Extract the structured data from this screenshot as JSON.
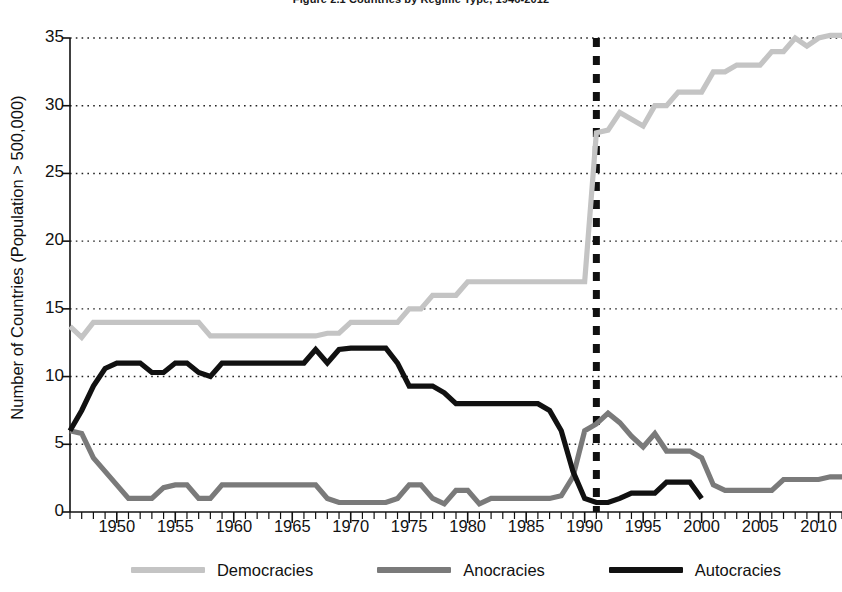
{
  "chart_data": {
    "type": "line",
    "title": "Figure 2.1 Countries by Regime Type, 1946-2012",
    "xlabel": "",
    "ylabel": "Number of Countries (Population > 500,000)",
    "xlim": [
      1946,
      2012
    ],
    "ylim": [
      0,
      35
    ],
    "yticks": [
      0,
      5,
      10,
      15,
      20,
      25,
      30,
      35
    ],
    "xticks": [
      1950,
      1955,
      1960,
      1965,
      1970,
      1975,
      1980,
      1985,
      1990,
      1995,
      2000,
      2005,
      2010
    ],
    "xtick_minor_step": 1,
    "grid": "horizontal-dotted",
    "legend_position": "bottom",
    "annotations": [
      {
        "type": "vline",
        "x": 1991,
        "style": "dashed",
        "color": "#111111",
        "width": 7
      }
    ],
    "x": [
      1946,
      1947,
      1948,
      1949,
      1950,
      1951,
      1952,
      1953,
      1954,
      1955,
      1956,
      1957,
      1958,
      1959,
      1960,
      1961,
      1962,
      1963,
      1964,
      1965,
      1966,
      1967,
      1968,
      1969,
      1970,
      1971,
      1972,
      1973,
      1974,
      1975,
      1976,
      1977,
      1978,
      1979,
      1980,
      1981,
      1982,
      1983,
      1984,
      1985,
      1986,
      1987,
      1988,
      1989,
      1990,
      1991,
      1992,
      1993,
      1994,
      1995,
      1996,
      1997,
      1998,
      1999,
      2000,
      2001,
      2002,
      2003,
      2004,
      2005,
      2006,
      2007,
      2008,
      2009,
      2010,
      2011,
      2012
    ],
    "series": [
      {
        "name": "Democracies",
        "color": "#c4c4c4",
        "values": [
          13.7,
          12.9,
          14,
          14,
          14,
          14,
          14,
          14,
          14,
          14,
          14,
          14,
          13,
          13,
          13,
          13,
          13,
          13,
          13,
          13,
          13,
          13,
          13.2,
          13.2,
          14,
          14,
          14,
          14,
          14,
          15,
          15,
          16,
          16,
          16,
          17,
          17,
          17,
          17,
          17,
          17,
          17,
          17,
          17,
          17,
          17,
          28,
          28.2,
          29.5,
          29,
          28.5,
          30,
          30,
          31,
          31,
          31,
          32.5,
          32.5,
          33,
          33,
          33,
          34,
          34,
          35,
          34.4,
          35,
          35.2,
          35.2
        ]
      },
      {
        "name": "Anocracies",
        "color": "#7a7a7a",
        "values": [
          6,
          5.8,
          4,
          3,
          2,
          1,
          1,
          1,
          1.8,
          2,
          2,
          1,
          1,
          2,
          2,
          2,
          2,
          2,
          2,
          2,
          2,
          2,
          1,
          0.7,
          0.7,
          0.7,
          0.7,
          0.7,
          1,
          2,
          2,
          1,
          0.6,
          1.6,
          1.6,
          0.6,
          1,
          1,
          1,
          1,
          1,
          1,
          1.2,
          2.6,
          6,
          6.5,
          7.3,
          6.6,
          5.6,
          4.8,
          5.8,
          4.5,
          4.5,
          4.5,
          4,
          2,
          1.6,
          1.6,
          1.6,
          1.6,
          1.6,
          2.4,
          2.4,
          2.4,
          2.4,
          2.6,
          2.6
        ]
      },
      {
        "name": "Autocracies",
        "color": "#111111",
        "values": [
          6,
          7.5,
          9.3,
          10.6,
          11,
          11,
          11,
          10.3,
          10.3,
          11,
          11,
          10.3,
          10,
          11,
          11,
          11,
          11,
          11,
          11,
          11,
          11,
          12,
          11,
          12,
          12.1,
          12.1,
          12.1,
          12.1,
          11,
          9.3,
          9.3,
          9.3,
          8.8,
          8,
          8,
          8,
          8,
          8,
          8,
          8,
          8,
          7.5,
          6,
          3,
          1,
          0.7,
          0.7,
          1,
          1.4,
          1.4,
          1.4,
          2.2,
          2.2,
          2.2,
          1,
          null,
          null,
          null,
          null,
          null,
          null,
          null,
          null,
          null,
          null,
          null,
          null
        ]
      }
    ]
  },
  "legend": {
    "items": [
      {
        "label": "Democracies",
        "color": "#c4c4c4"
      },
      {
        "label": "Anocracies",
        "color": "#7a7a7a"
      },
      {
        "label": "Autocracies",
        "color": "#111111"
      }
    ]
  },
  "axes": {
    "y_axis_label": "Number of Countries (Population > 500,000)",
    "y_tick_labels": [
      "35",
      "30",
      "25",
      "20",
      "15",
      "10",
      "5",
      "0"
    ],
    "x_tick_labels": [
      "1950",
      "1955",
      "1960",
      "1965",
      "1970",
      "1975",
      "1980",
      "1985",
      "1990",
      "1995",
      "2000",
      "2005",
      "2010"
    ]
  }
}
